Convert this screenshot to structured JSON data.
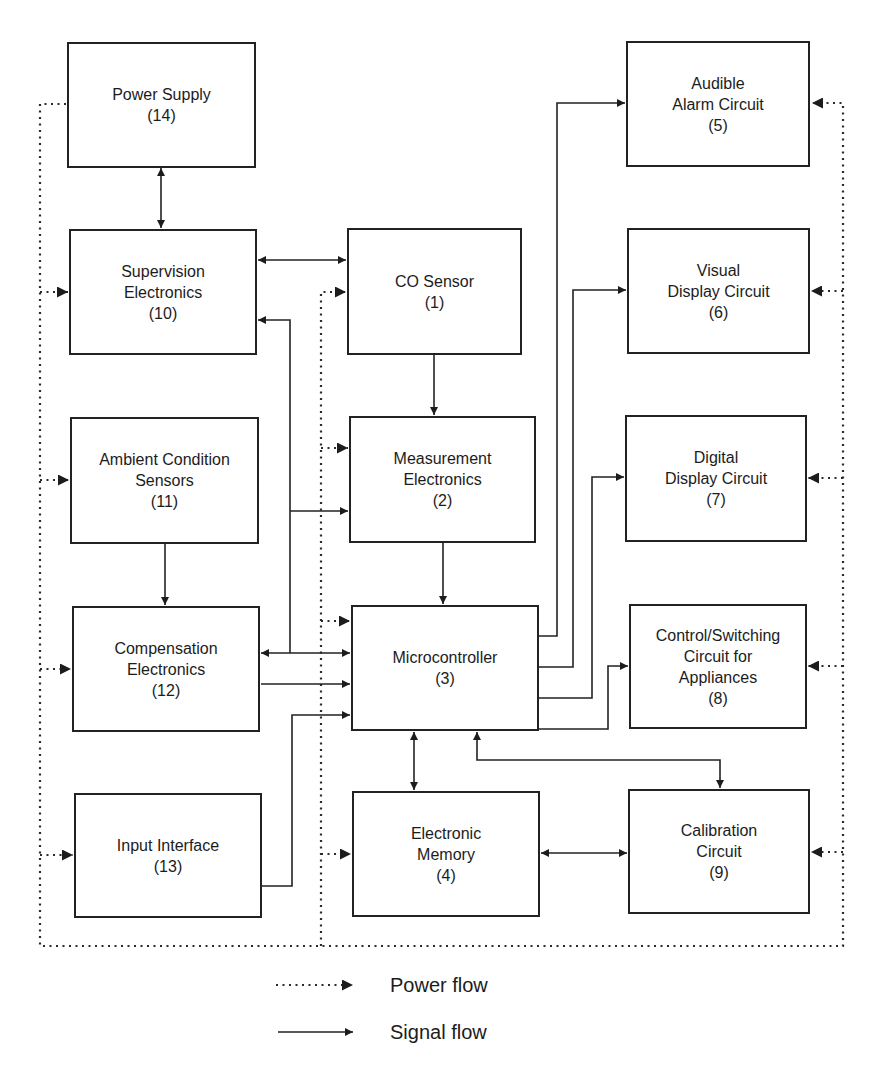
{
  "diagram": {
    "blocks": {
      "co_sensor": {
        "line1": "CO Sensor",
        "number": "(1)"
      },
      "measurement": {
        "line1": "Measurement",
        "line2": "Electronics",
        "number": "(2)"
      },
      "microcontroller": {
        "line1": "Microcontroller",
        "number": "(3)"
      },
      "memory": {
        "line1": "Electronic",
        "line2": "Memory",
        "number": "(4)"
      },
      "audible_alarm": {
        "line1": "Audible",
        "line2": "Alarm Circuit",
        "number": "(5)"
      },
      "visual_display": {
        "line1": "Visual",
        "line2": "Display Circuit",
        "number": "(6)"
      },
      "digital_display": {
        "line1": "Digital",
        "line2": "Display Circuit",
        "number": "(7)"
      },
      "control_switching": {
        "line1": "Control/Switching",
        "line2": "Circuit for",
        "line3": "Appliances",
        "number": "(8)"
      },
      "calibration": {
        "line1": "Calibration",
        "line2": "Circuit",
        "number": "(9)"
      },
      "supervision": {
        "line1": "Supervision",
        "line2": "Electronics",
        "number": "(10)"
      },
      "ambient_sensors": {
        "line1": "Ambient Condition",
        "line2": "Sensors",
        "number": "(11)"
      },
      "compensation": {
        "line1": "Compensation",
        "line2": "Electronics",
        "number": "(12)"
      },
      "input_interface": {
        "line1": "Input Interface",
        "number": "(13)"
      },
      "power_supply": {
        "line1": "Power Supply",
        "number": "(14)"
      }
    },
    "connections": {
      "signal": [
        {
          "from": "14",
          "to": "10",
          "direction": "bidirectional"
        },
        {
          "from": "10",
          "to": "1",
          "direction": "bidirectional"
        },
        {
          "from": "1",
          "to": "2",
          "direction": "forward"
        },
        {
          "from": "2",
          "to": "3",
          "direction": "forward"
        },
        {
          "from": "11",
          "to": "12",
          "direction": "forward"
        },
        {
          "from": "12",
          "to": "3",
          "direction": "bidirectional"
        },
        {
          "from": "12",
          "to": "3",
          "direction": "forward"
        },
        {
          "from": "12/3 bus",
          "to": "10",
          "direction": "forward"
        },
        {
          "from": "12/3 bus",
          "to": "2",
          "direction": "forward"
        },
        {
          "from": "13",
          "to": "3",
          "direction": "forward"
        },
        {
          "from": "3",
          "to": "5",
          "direction": "forward"
        },
        {
          "from": "3",
          "to": "6",
          "direction": "forward"
        },
        {
          "from": "3",
          "to": "7",
          "direction": "forward"
        },
        {
          "from": "3",
          "to": "8",
          "direction": "forward"
        },
        {
          "from": "3",
          "to": "4",
          "direction": "bidirectional"
        },
        {
          "from": "3",
          "to": "9",
          "direction": "bidirectional"
        },
        {
          "from": "4",
          "to": "9",
          "direction": "bidirectional"
        }
      ],
      "power": [
        {
          "from": "14",
          "to": [
            "10",
            "11",
            "12",
            "13",
            "1",
            "2",
            "3",
            "4",
            "5",
            "6",
            "7",
            "8",
            "9"
          ]
        }
      ]
    },
    "legend": {
      "power_label": "Power flow",
      "signal_label": "Signal flow"
    }
  }
}
